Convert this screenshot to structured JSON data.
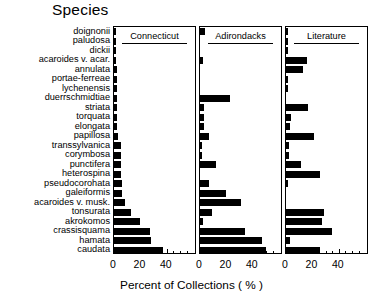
{
  "title": "Species",
  "axis_title": "Percent of Collections ( % )",
  "panels": [
    {
      "name": "Connecticut"
    },
    {
      "name": "Adirondacks"
    },
    {
      "name": "Literature"
    }
  ],
  "tick_labels": [
    "0",
    "20",
    "40"
  ],
  "chart_data": {
    "type": "bar",
    "title": "Species",
    "xlabel": "Percent of Collections ( % )",
    "ylabel": "Species",
    "orientation": "horizontal",
    "grid": false,
    "legend": "none",
    "xlim": [
      0,
      55
    ],
    "xticks": [
      0,
      20,
      40
    ],
    "xtick_labels": [
      "0",
      "20",
      "40"
    ],
    "panel_layout": "three side-by-side panels sharing one species axis",
    "categories": [
      "doignonii",
      "paludosa",
      "dickii",
      "acaroides v. acar.",
      "annulata",
      "portae-ferreae",
      "lychenensis",
      "duerrschmidtiae",
      "striata",
      "torquata",
      "elongata",
      "papillosa",
      "transsylvanica",
      "corymbosa",
      "punctifera",
      "heterospina",
      "pseudocorohata",
      "galeiformis",
      "acaroides v. musk.",
      "tonsurata",
      "akrokomos",
      "crassisquama",
      "hamata",
      "caudata"
    ],
    "series": [
      {
        "name": "Connecticut",
        "values": [
          1,
          1,
          1,
          1,
          2,
          2,
          2,
          2,
          2,
          2,
          2,
          3,
          5,
          5,
          5,
          5,
          6,
          6,
          8,
          13,
          20,
          27,
          28,
          37
        ]
      },
      {
        "name": "Adirondacks",
        "values": [
          4,
          0,
          0,
          2,
          0,
          0,
          0,
          23,
          3,
          3,
          3,
          7,
          1,
          1,
          12,
          0,
          7,
          20,
          31,
          9,
          2,
          34,
          47,
          50
        ]
      },
      {
        "name": "Literature",
        "values": [
          1,
          1,
          1,
          16,
          13,
          1,
          1,
          0,
          17,
          4,
          3,
          21,
          2,
          2,
          11,
          26,
          1,
          0,
          0,
          29,
          27,
          35,
          3,
          26
        ]
      }
    ]
  }
}
